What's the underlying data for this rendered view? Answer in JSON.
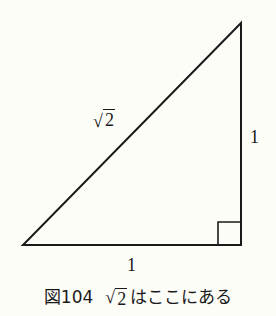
{
  "figure": {
    "shape": "right-triangle",
    "vertices": {
      "bottom_left": [
        23,
        245
      ],
      "bottom_right": [
        241,
        245
      ],
      "top_right": [
        241,
        23
      ]
    },
    "right_angle_marker": {
      "x": 218,
      "y": 222,
      "size": 23
    },
    "stroke_color": "#1a1a1a",
    "labels": {
      "hypotenuse": {
        "radical": "√",
        "radicand": "2"
      },
      "right_side": "1",
      "bottom_side": "1"
    }
  },
  "caption": {
    "figure_number": "図104",
    "radical": "√",
    "radicand": "2",
    "text": "はここにある"
  }
}
